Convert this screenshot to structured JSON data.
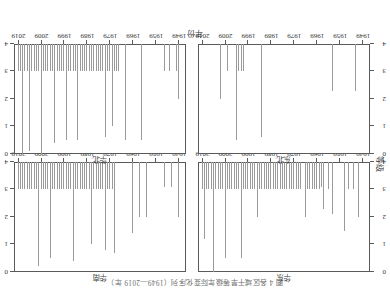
{
  "figure": {
    "title": "图 4 各区域干旱等级年际变化序列（1949—2019 年）",
    "x_axis_label": "年份",
    "y_axis_label": "等级"
  },
  "chart_data": {
    "type": "bar",
    "title": "图 4 各区域干旱等级年际变化序列（1949—2019 年）",
    "xlabel": "年份",
    "ylabel": "等级",
    "xlim": [
      1946,
      2021
    ],
    "ylim": [
      0,
      4
    ],
    "yticks": [
      0,
      1,
      2,
      3,
      4
    ],
    "xticks": [
      1949,
      1959,
      1969,
      1979,
      1989,
      1999,
      2009,
      2019
    ],
    "xticklabels": [
      "1949",
      "1959",
      "1969",
      "1979",
      "1989",
      "1999",
      "2009",
      "2019"
    ],
    "grid": false,
    "legend": "none",
    "orientation": "rotated-180",
    "panels": [
      {
        "id": "panel-top-left",
        "title": "华东",
        "x": [
          1951,
          1953,
          1955,
          1957,
          1959,
          1961,
          1962,
          1964,
          1966,
          1967,
          1968,
          1969,
          1970,
          1971,
          1972,
          1973,
          1974,
          1975,
          1976,
          1977,
          1978,
          1979,
          1980,
          1981,
          1982,
          1983,
          1984,
          1985,
          1986,
          1987,
          1988,
          1989,
          1990,
          1991,
          1992,
          1993,
          1994,
          1995,
          1996,
          1997,
          1998,
          1999,
          2000,
          2001,
          2002,
          2003,
          2004,
          2005,
          2006,
          2007,
          2008,
          2009,
          2010,
          2011,
          2012,
          2013,
          2014,
          2015,
          2016,
          2017,
          2018,
          2019
        ],
        "values": [
          2.0,
          1.0,
          1.0,
          2.5,
          0.0,
          0.0,
          1.9,
          1.0,
          1.7,
          0.9,
          1.0,
          1.0,
          1.0,
          1.0,
          1.0,
          1.0,
          2.0,
          0.0,
          1.0,
          1.0,
          1.0,
          1.0,
          1.0,
          1.0,
          1.0,
          1.0,
          1.0,
          1.0,
          1.0,
          1.0,
          1.0,
          1.0,
          1.0,
          1.0,
          1.0,
          1.0,
          1.0,
          2.0,
          1.0,
          1.0,
          1.0,
          1.0,
          1.0,
          1.0,
          3.5,
          1.0,
          1.0,
          1.0,
          1.0,
          1.0,
          1.0,
          3.5,
          1.0,
          1.0,
          1.0,
          1.0,
          4.0,
          1.0,
          1.0,
          1.0,
          2.8,
          1.0
        ]
      },
      {
        "id": "panel-top-right",
        "title": "华南",
        "x": [
          1949,
          1952,
          1955,
          1963,
          1966,
          1969,
          1977,
          1978,
          1979,
          1980,
          1981,
          1982,
          1983,
          1984,
          1985,
          1986,
          1987,
          1988,
          1989,
          1990,
          1991,
          1992,
          1993,
          1994,
          1995,
          1996,
          1997,
          1998,
          1999,
          2000,
          2001,
          2002,
          2003,
          2004,
          2005,
          2006,
          2007,
          2008,
          2009,
          2010,
          2011,
          2012,
          2013,
          2014,
          2015,
          2016,
          2017,
          2018,
          2019
        ],
        "values": [
          2.0,
          0.9,
          0.9,
          2.0,
          2.0,
          2.6,
          3.3,
          1.0,
          1.0,
          1.0,
          3.2,
          1.0,
          1.0,
          1.0,
          1.0,
          1.0,
          3.0,
          1.0,
          1.0,
          1.0,
          1.0,
          1.0,
          1.0,
          1.0,
          3.6,
          1.0,
          1.0,
          1.0,
          1.0,
          1.0,
          1.0,
          1.0,
          1.0,
          1.0,
          3.5,
          1.0,
          1.0,
          1.0,
          1.0,
          3.8,
          1.0,
          1.0,
          1.0,
          1.0,
          1.0,
          1.0,
          1.0,
          1.0,
          1.0
        ]
      },
      {
        "id": "panel-bottom-left",
        "title": "东北",
        "x": [
          1952,
          1962,
          1993,
          2001,
          2002,
          2003,
          2004,
          2008,
          2011
        ],
        "values": [
          1.7,
          1.7,
          3.4,
          1.0,
          1.0,
          1.0,
          3.5,
          1.0,
          2.0
        ]
      },
      {
        "id": "panel-bottom-right",
        "title": "华北",
        "x": [
          1949,
          1950,
          1953,
          1955,
          1965,
          1972,
          1975,
          1976,
          1977,
          1978,
          1979,
          1980,
          1981,
          1982,
          1983,
          1984,
          1985,
          1986,
          1987,
          1988,
          1989,
          1990,
          1991,
          1992,
          1993,
          1994,
          1995,
          1996,
          1997,
          1998,
          1999,
          2000,
          2001,
          2002,
          2003,
          2004,
          2005,
          2006,
          2007,
          2008,
          2009,
          2010,
          2011,
          2012,
          2013,
          2014,
          2015,
          2016,
          2017,
          2018,
          2019
        ],
        "values": [
          2.0,
          1.0,
          1.0,
          1.0,
          3.5,
          3.5,
          1.0,
          1.0,
          1.0,
          3.0,
          1.0,
          1.0,
          3.4,
          1.0,
          1.0,
          1.0,
          1.0,
          1.0,
          1.0,
          1.0,
          1.0,
          1.0,
          1.0,
          1.0,
          3.5,
          1.0,
          1.0,
          1.0,
          1.0,
          3.5,
          1.0,
          1.0,
          1.0,
          1.0,
          3.6,
          1.0,
          1.0,
          1.0,
          1.0,
          1.0,
          4.0,
          1.0,
          1.0,
          1.0,
          1.0,
          3.9,
          1.0,
          1.0,
          4.0,
          1.0,
          1.0
        ]
      }
    ],
    "colors": {
      "spike": "#9a9a9a",
      "frame": "#5a5a5a",
      "text": "#333333"
    }
  }
}
